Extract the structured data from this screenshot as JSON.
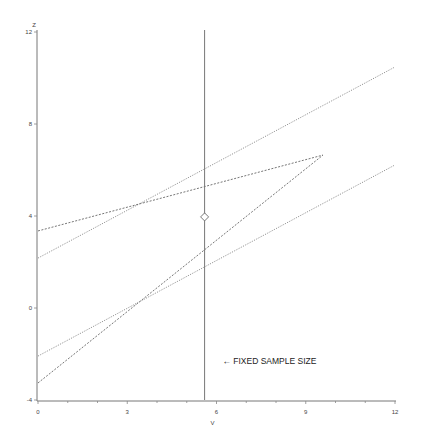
{
  "chart_data": {
    "type": "line",
    "title": "",
    "xlabel": "V",
    "ylabel": "Z",
    "xlim": [
      0,
      12
    ],
    "ylim": [
      -4,
      12
    ],
    "xticks": [
      0,
      3,
      6,
      9,
      12
    ],
    "yticks": [
      -4,
      0,
      4,
      8,
      12
    ],
    "grid": false,
    "legend": null,
    "series": [
      {
        "name": "upper boundary (dotted)",
        "style": "dotted",
        "points": [
          [
            0,
            2.17
          ],
          [
            12,
            10.48
          ]
        ]
      },
      {
        "name": "upper triangular boundary (dashed)",
        "style": "dashed",
        "points": [
          [
            0,
            3.35
          ],
          [
            9.58,
            6.65
          ]
        ]
      },
      {
        "name": "lower triangular boundary (dashed)",
        "style": "dashed",
        "points": [
          [
            0,
            -3.26
          ],
          [
            9.58,
            6.65
          ]
        ]
      },
      {
        "name": "lower boundary (dotted)",
        "style": "dotted",
        "points": [
          [
            0,
            -2.09
          ],
          [
            12,
            6.22
          ]
        ]
      },
      {
        "name": "fixed sample size",
        "style": "solid",
        "points": [
          [
            5.6,
            -4
          ],
          [
            5.6,
            12
          ]
        ]
      }
    ],
    "markers": [
      {
        "shape": "diamond",
        "x": 5.6,
        "y": 3.96
      }
    ],
    "annotations": [
      {
        "text": "← FIXED SAMPLE SIZE",
        "x": 6.2,
        "y": -2
      }
    ]
  },
  "labels": {
    "xlabel": "V",
    "ylabel": "Z",
    "annotation": "← FIXED SAMPLE SIZE"
  }
}
